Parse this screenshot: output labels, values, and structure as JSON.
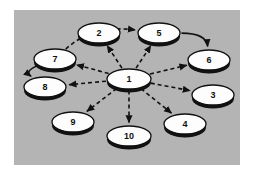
{
  "figure": {
    "background_color": "#ffffff",
    "panel_color": "#b4b4b4",
    "node_fill": "#fdfdfd",
    "node_stroke": "#111111",
    "node_shadow": "#111111",
    "edge_color": "#111111"
  },
  "nodes": [
    {
      "id": "1",
      "label": "1",
      "cx": 129,
      "cy": 79,
      "rx": 22,
      "ry": 10
    },
    {
      "id": "2",
      "label": "2",
      "cx": 99,
      "cy": 33,
      "rx": 21,
      "ry": 10
    },
    {
      "id": "3",
      "label": "3",
      "cx": 213,
      "cy": 95,
      "rx": 21,
      "ry": 10
    },
    {
      "id": "4",
      "label": "4",
      "cx": 185,
      "cy": 124,
      "rx": 21,
      "ry": 10
    },
    {
      "id": "5",
      "label": "5",
      "cx": 159,
      "cy": 33,
      "rx": 21,
      "ry": 10
    },
    {
      "id": "6",
      "label": "6",
      "cx": 209,
      "cy": 60,
      "rx": 21,
      "ry": 10
    },
    {
      "id": "7",
      "label": "7",
      "cx": 55,
      "cy": 59,
      "rx": 21,
      "ry": 10
    },
    {
      "id": "8",
      "label": "8",
      "cx": 45,
      "cy": 87,
      "rx": 21,
      "ry": 10
    },
    {
      "id": "9",
      "label": "9",
      "cx": 73,
      "cy": 122,
      "rx": 21,
      "ry": 10
    },
    {
      "id": "10",
      "label": "10",
      "cx": 129,
      "cy": 136,
      "rx": 22,
      "ry": 10
    }
  ],
  "edges": [
    {
      "from": "1",
      "to": "2",
      "style": "dashed",
      "shape": "straight",
      "arrow": true
    },
    {
      "from": "1",
      "to": "5",
      "style": "dashed",
      "shape": "straight",
      "arrow": true
    },
    {
      "from": "1",
      "to": "6",
      "style": "dashed",
      "shape": "straight",
      "arrow": true
    },
    {
      "from": "1",
      "to": "3",
      "style": "dashed",
      "shape": "straight",
      "arrow": true
    },
    {
      "from": "1",
      "to": "4",
      "style": "dashed",
      "shape": "straight",
      "arrow": true
    },
    {
      "from": "1",
      "to": "10",
      "style": "dashed",
      "shape": "straight",
      "arrow": true
    },
    {
      "from": "1",
      "to": "9",
      "style": "dashed",
      "shape": "straight",
      "arrow": true
    },
    {
      "from": "1",
      "to": "8",
      "style": "dashed",
      "shape": "straight",
      "arrow": true
    },
    {
      "from": "1",
      "to": "7",
      "style": "dashed",
      "shape": "straight",
      "arrow": true
    },
    {
      "from": "7",
      "to": "5",
      "style": "dashed",
      "shape": "arc",
      "arrow": true
    },
    {
      "from": "5",
      "to": "6",
      "style": "solid",
      "shape": "arc",
      "arrow": true
    },
    {
      "from": "7",
      "to": "8",
      "style": "solid",
      "shape": "arc",
      "arrow": true
    }
  ]
}
